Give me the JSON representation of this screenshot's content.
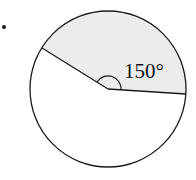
{
  "diagram": {
    "type": "circle-sector",
    "angle_label": "150°",
    "angle_degrees": 150,
    "shaded_region": "sector",
    "colors": {
      "stroke": "#1a1a1a",
      "shade": "#ececec",
      "background": "#ffffff"
    },
    "bullet": "•"
  }
}
